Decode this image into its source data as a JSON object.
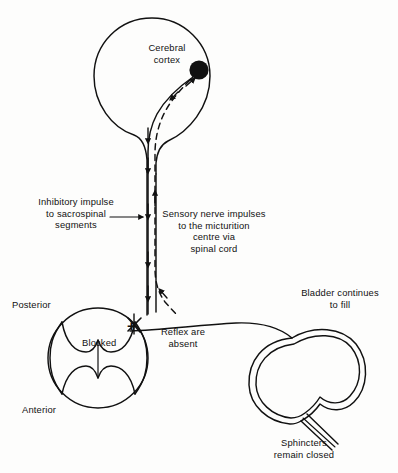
{
  "figure": {
    "background_color": "#fdfdfc",
    "ink_color": "#111111",
    "width": 398,
    "height": 473
  },
  "labels": {
    "cerebral_cortex": "Cerebral\ncortex",
    "inhibitory_impulse": "Inhibitory impulse\nto sacrospinal\nsegments",
    "sensory_impulses": "Sensory nerve impulses\nto the micturition\ncentre via\nspinal cord",
    "posterior": "Posterior",
    "anterior": "Anterior",
    "blocked": "Blocked",
    "blocked_plus": "+",
    "reflex_absent": "Reflex are\nabsent",
    "bladder_fill": "Bladder continues\nto fill",
    "sphincters": "Sphincters\nremain closed"
  },
  "structures": {
    "brain_outline": "cerebral hemisphere balloon",
    "cortex_node": "filled black circle at micturition centre",
    "spinal_cord_tract": "vertical spinal cord column",
    "spinal_cord_section": "transverse cord section with butterfly grey matter",
    "bladder": "double-walled distended bladder",
    "urethra": "urethral tube with closed sphincters"
  },
  "pathways": [
    {
      "name": "descending-inhibitory-tract",
      "style": "solid",
      "direction": "downward",
      "arrow_count": 5,
      "description": "Inhibitory impulse from cortex to sacrospinal segments"
    },
    {
      "name": "ascending-sensory-tract",
      "style": "dashed",
      "direction": "upward",
      "arrow_count": 3,
      "description": "Sensory nerve impulses to micturition centre via spinal cord"
    }
  ],
  "annotations": {
    "block_marker": "cross-hatch block on reflex arc at cord section",
    "leader_arrow_inhibitory": "horizontal arrow pointing right to spinal tract"
  }
}
